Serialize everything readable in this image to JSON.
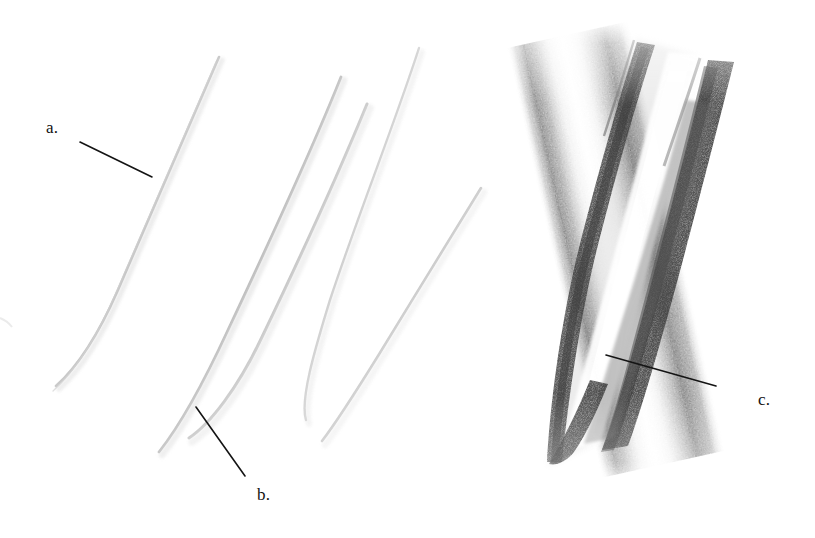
{
  "figure": {
    "background_color": "#ffffff",
    "width": 815,
    "height": 538,
    "ink_color": "#111111",
    "streak_dark_color": "#5a5a5a",
    "streak_faint_color": "#c9c9c9"
  },
  "labels": [
    {
      "id": "a",
      "text": "a.",
      "x": 46,
      "y": 119,
      "leader": {
        "x1": 80,
        "y1": 142,
        "x2": 152,
        "y2": 177
      },
      "points_to": "faint-single-streak-left"
    },
    {
      "id": "b",
      "text": "b.",
      "x": 257,
      "y": 486,
      "leader": {
        "x1": 196,
        "y1": 407,
        "x2": 245,
        "y2": 476
      },
      "points_to": "faint-double-streak-middle"
    },
    {
      "id": "c",
      "text": "c.",
      "x": 758,
      "y": 391,
      "leader": {
        "x1": 606,
        "y1": 355,
        "x2": 716,
        "y2": 386
      },
      "points_to": "broad-dark-band-right"
    }
  ],
  "chart_data": {
    "type": "scatter",
    "title": "",
    "xlabel": "",
    "ylabel": "",
    "grid": false,
    "legend": null,
    "xlim": [
      0,
      815
    ],
    "ylim": [
      0,
      538
    ],
    "annotations": [
      "a.",
      "b.",
      "c."
    ],
    "features": [
      {
        "name": "streak-a",
        "kind": "faint-line",
        "label": "a",
        "x_top": 219,
        "y_top": 57,
        "x_bot": 56,
        "y_bot": 386,
        "width_px": 3.0,
        "intensity": 0.16,
        "color": "#b9b9b9"
      },
      {
        "name": "streak-b1",
        "kind": "faint-line",
        "label": "b",
        "x_top": 341,
        "y_top": 77,
        "x_bot": 159,
        "y_bot": 452,
        "width_px": 3.5,
        "intensity": 0.22,
        "color": "#b0b0b0"
      },
      {
        "name": "streak-b2",
        "kind": "faint-line",
        "label": "b",
        "x_top": 366,
        "y_top": 104,
        "x_bot": 188,
        "y_bot": 438,
        "width_px": 4.0,
        "intensity": 0.2,
        "color": "#b8b8b8"
      },
      {
        "name": "streak-c-left-satellite",
        "kind": "faint-line",
        "label": "",
        "x_top": 418,
        "y_top": 48,
        "x_bot": 305,
        "y_bot": 420,
        "width_px": 3.0,
        "intensity": 0.15,
        "color": "#c0c0c0"
      },
      {
        "name": "streak-c-mid-satellite",
        "kind": "faint-line",
        "label": "",
        "x_top": 480,
        "y_top": 188,
        "x_bot": 322,
        "y_bot": 440,
        "width_px": 3.5,
        "intensity": 0.17,
        "color": "#bcbcbc"
      },
      {
        "name": "band-c",
        "kind": "broad-dark-band",
        "label": "c",
        "x_top": 640,
        "y_top": 40,
        "x_bot": 548,
        "y_bot": 466,
        "width_px": 120,
        "intensity": 0.72,
        "color": "#555555",
        "note": "dark left rim, bright central stripe, dark right rim"
      }
    ]
  }
}
